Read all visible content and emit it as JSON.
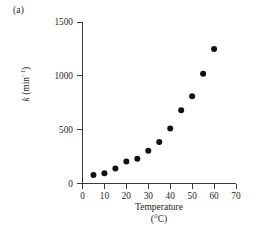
{
  "figure": {
    "panel_label": "(a)",
    "background": "#ffffff",
    "marker_color": "#111111",
    "axis_color": "#3a3a3a",
    "text_color": "#262626"
  },
  "chart_data": {
    "type": "scatter",
    "title": "",
    "xlabel": "Temperature",
    "xlabel_unit": "(°C)",
    "ylabel": "k (min⁻¹)",
    "ylabel_symbol": "k",
    "ylabel_units": "(min",
    "ylabel_exponent": "−1",
    "ylabel_units_close": ")",
    "xlim": [
      0,
      70
    ],
    "ylim": [
      0,
      1500
    ],
    "xticks": [
      0,
      10,
      20,
      30,
      40,
      50,
      60,
      70
    ],
    "yticks": [
      0,
      500,
      1000,
      1500
    ],
    "grid": false,
    "legend": false,
    "x": [
      5,
      10,
      15,
      20,
      25,
      30,
      35,
      40,
      45,
      50,
      55,
      60
    ],
    "y": [
      80,
      95,
      140,
      205,
      230,
      305,
      385,
      510,
      680,
      810,
      1020,
      1250
    ],
    "points": [
      {
        "x": 5,
        "y": 80
      },
      {
        "x": 10,
        "y": 95
      },
      {
        "x": 15,
        "y": 140
      },
      {
        "x": 20,
        "y": 205
      },
      {
        "x": 25,
        "y": 230
      },
      {
        "x": 30,
        "y": 305
      },
      {
        "x": 35,
        "y": 385
      },
      {
        "x": 40,
        "y": 510
      },
      {
        "x": 45,
        "y": 680
      },
      {
        "x": 50,
        "y": 810
      },
      {
        "x": 55,
        "y": 1020
      },
      {
        "x": 60,
        "y": 1250
      }
    ]
  }
}
